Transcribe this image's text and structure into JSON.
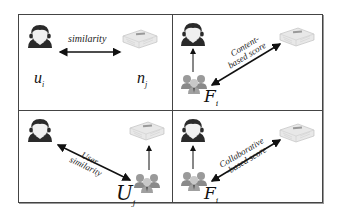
{
  "diagram": {
    "panels": [
      {
        "id": "top-left",
        "nodes": [
          {
            "icon": "user-icon",
            "label": "u",
            "sub": "i"
          },
          {
            "icon": "newspaper-icon",
            "label": "n",
            "sub": "j"
          }
        ],
        "edges": [
          {
            "from": "user",
            "to": "news",
            "type": "bidirectional",
            "label": "similarity"
          }
        ]
      },
      {
        "id": "top-right",
        "nodes": [
          {
            "icon": "user-icon"
          },
          {
            "icon": "group-icon",
            "label": "F",
            "sub": "i"
          },
          {
            "icon": "newspaper-icon"
          }
        ],
        "edges": [
          {
            "from": "group",
            "to": "user",
            "type": "arrow"
          },
          {
            "from": "group",
            "to": "news",
            "type": "bidirectional",
            "label_line1": "Content-",
            "label_line2": "based score"
          }
        ]
      },
      {
        "id": "bottom-left",
        "nodes": [
          {
            "icon": "user-icon"
          },
          {
            "icon": "group-icon",
            "label": "U",
            "sub": "j"
          },
          {
            "icon": "newspaper-icon"
          }
        ],
        "edges": [
          {
            "from": "user",
            "to": "group",
            "type": "bidirectional",
            "label_line1": "User",
            "label_line2": "similarity"
          },
          {
            "from": "group",
            "to": "news",
            "type": "arrow"
          }
        ]
      },
      {
        "id": "bottom-right",
        "nodes": [
          {
            "icon": "user-icon"
          },
          {
            "icon": "group-icon",
            "label": "F",
            "sub": "i"
          },
          {
            "icon": "newspaper-icon"
          }
        ],
        "edges": [
          {
            "from": "group",
            "to": "user",
            "type": "arrow"
          },
          {
            "from": "group",
            "to": "news",
            "type": "bidirectional",
            "label_line1": "Collaborative",
            "label_line2": "-based score"
          }
        ]
      }
    ]
  },
  "labels": {
    "tl_edge": "similarity",
    "tl_user": "u",
    "tl_user_sub": "i",
    "tl_news": "n",
    "tl_news_sub": "j",
    "tr_edge_1": "Content-",
    "tr_edge_2": "based score",
    "tr_group": "F",
    "tr_group_sub": "i",
    "bl_edge_1": "User",
    "bl_edge_2": "similarity",
    "bl_group": "U",
    "bl_group_sub": "j",
    "br_edge_1": "Collaborative",
    "br_edge_2": "-based score",
    "br_group": "F",
    "br_group_sub": "i"
  },
  "colors": {
    "border": "#444444",
    "arrow": "#111111",
    "user_hair": "#2a2a2a",
    "user_face": "#f0f0f0",
    "news_paper": "#e6e6e6",
    "group": "#8a8a8a"
  }
}
